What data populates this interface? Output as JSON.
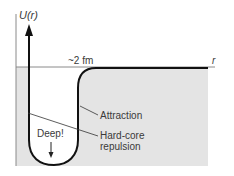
{
  "diagram": {
    "y_axis_label": "U(r)",
    "x_axis_label": "r",
    "range_label": "~2 fm",
    "well_label": "Deep!",
    "annotations": [
      {
        "id": "attraction",
        "text": "Attraction"
      },
      {
        "id": "hard-core",
        "line1": "Hard-core",
        "line2": "repulsion"
      }
    ],
    "colors": {
      "fill": "#e4e4e4",
      "curve": "#111111",
      "axis": "#777777",
      "text": "#3a3a3a"
    }
  }
}
